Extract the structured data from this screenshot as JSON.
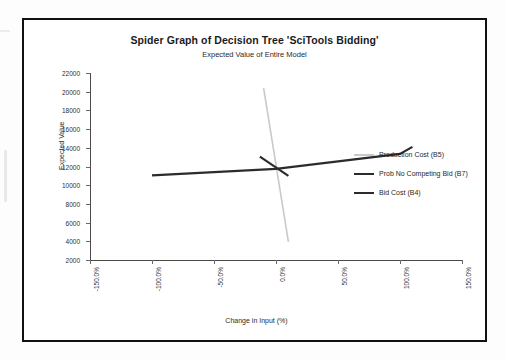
{
  "chart_data": {
    "type": "line",
    "title": "Spider Graph of Decision Tree 'SciTools Bidding'",
    "subtitle": "Expected Value of Entire Model",
    "xlabel": "Change in Input (%)",
    "ylabel": "Expected Value",
    "xlim": [
      -150,
      150
    ],
    "ylim": [
      2000,
      22000
    ],
    "xticks": [
      "-150.0%",
      "-100.0%",
      "-50.0%",
      "0.0%",
      "50.0%",
      "100.0%",
      "150.0%"
    ],
    "xtick_values": [
      -150,
      -100,
      -50,
      0,
      50,
      100,
      150
    ],
    "yticks": [
      "2000",
      "4000",
      "6000",
      "8000",
      "10000",
      "12000",
      "14000",
      "16000",
      "18000",
      "20000",
      "22000"
    ],
    "ytick_values": [
      2000,
      4000,
      6000,
      8000,
      10000,
      12000,
      14000,
      16000,
      18000,
      20000,
      22000
    ],
    "grid": false,
    "legend_position": "center-right",
    "series": [
      {
        "name": "Production Cost (B5)",
        "color": "#c9c9c9",
        "width": 1.6,
        "x": [
          -10,
          10
        ],
        "y": [
          20400,
          3950
        ]
      },
      {
        "name": "Prob No Competing Bid (B7)",
        "color": "#2c2c2c",
        "width": 2.2,
        "x": [
          -100,
          0,
          100,
          110
        ],
        "y": [
          11050,
          11750,
          13350,
          14100
        ]
      },
      {
        "name": "Bid Cost (B4)",
        "color": "#2c2c2c",
        "width": 2.2,
        "x": [
          -13,
          10
        ],
        "y": [
          13050,
          11000
        ]
      }
    ]
  },
  "legend": {
    "items": [
      {
        "label": "Production Cost (B5)",
        "color": "#c9c9c9"
      },
      {
        "label": "Prob No Competing Bid (B7)",
        "color": "#2c2c2c"
      },
      {
        "label": "Bid Cost (B4)",
        "color": "#2c2c2c"
      }
    ]
  }
}
